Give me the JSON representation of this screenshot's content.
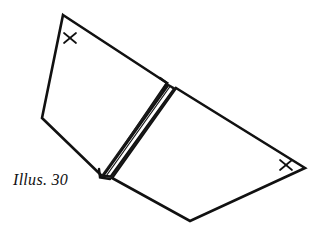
{
  "figure": {
    "caption": "Illus. 30",
    "background_color": "#ffffff",
    "ink_color": "#111111",
    "width": 321,
    "height": 239,
    "marks": [
      {
        "id": "left-panel-mark",
        "label": "X",
        "x": 70,
        "y": 38
      },
      {
        "id": "right-panel-mark",
        "label": "X",
        "x": 285,
        "y": 169
      }
    ],
    "shapes": {
      "left_panel": {
        "name": "left-panel",
        "points": "63,15 167,83 103,177 42,118"
      },
      "right_panel": {
        "name": "right-panel",
        "points": "176,88 305,168 190,221 112,178"
      },
      "spine_outer": {
        "name": "spine-outer-band",
        "points": "167,83 176,88 112,178 100,177"
      },
      "spine_inner": {
        "name": "spine-inner-fold",
        "points": "168,85 174,89 110,176 103,176"
      },
      "spine_crease": {
        "name": "spine-crease-line",
        "points": "166,84 101,176"
      },
      "spine_notch_left": {
        "name": "spine-notch-left",
        "points": "160,79 167,83 162,90"
      },
      "spine_notch_bottom": {
        "name": "spine-notch-bottom",
        "points": "100,170 100,177 108,179"
      }
    }
  }
}
